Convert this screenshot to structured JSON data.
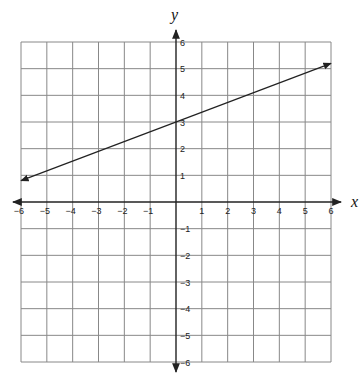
{
  "chart_data": {
    "type": "line",
    "title": "",
    "xlabel": "x",
    "ylabel": "y",
    "xlim": [
      -6,
      6
    ],
    "ylim": [
      -6,
      6
    ],
    "grid": true,
    "x_ticks": [
      "-6",
      "-5",
      "-4",
      "-3",
      "-2",
      "-1",
      "1",
      "2",
      "3",
      "4",
      "5",
      "6"
    ],
    "y_ticks": [
      "6",
      "5",
      "4",
      "3",
      "2",
      "1",
      "-1",
      "-2",
      "-3",
      "-4",
      "-5",
      "-6"
    ],
    "series": [
      {
        "name": "line",
        "x": [
          -6,
          0,
          6
        ],
        "y": [
          0.8,
          3,
          5.2
        ],
        "arrows": "both",
        "equation_estimate": "y = 0.37x + 3"
      }
    ]
  },
  "colors": {
    "grid": "#888888",
    "axis": "#222222",
    "line": "#222222"
  }
}
